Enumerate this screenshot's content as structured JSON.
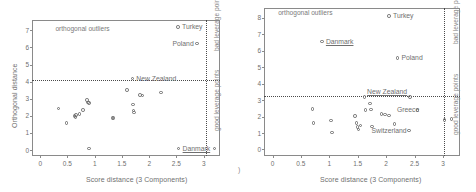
{
  "figure": {
    "panel_count": 2,
    "corner_mark": ")"
  },
  "chart_data": [
    {
      "type": "scatter",
      "title": "",
      "panel": "left",
      "xlabel": "Score distance (3 Components)",
      "ylabel": "Orthogonal distance",
      "xlim": [
        -0.15,
        3.3
      ],
      "ylim": [
        -0.35,
        7.6
      ],
      "xticks": [
        0,
        0.5,
        1,
        1.5,
        2,
        2.5,
        3
      ],
      "xticklabels": [
        "0",
        "0.5",
        "1",
        "1.5",
        "2",
        "2.5",
        "3"
      ],
      "yticks": [
        0,
        1,
        2,
        3,
        4,
        5,
        6,
        7
      ],
      "yticklabels": [
        "0",
        "1",
        "2",
        "3",
        "4",
        "5",
        "6",
        "7"
      ],
      "grid": false,
      "cutoff_horizontal": 4.1,
      "cutoff_vertical": 3.05,
      "annotations": [
        {
          "text": "orthogonal outliers",
          "x": 0.28,
          "y": 7.1,
          "underline": false
        },
        {
          "text": "bad leverage points",
          "x": 3.14,
          "y": 5.8,
          "rotated": true
        },
        {
          "text": "good leverage points",
          "x": 3.14,
          "y": 1.1,
          "rotated": true
        }
      ],
      "points": [
        {
          "x": 2.53,
          "y": 7.18,
          "label": "Turkey",
          "label_pos": "right"
        },
        {
          "x": 2.88,
          "y": 6.22,
          "label": "Poland",
          "label_pos": "left"
        },
        {
          "x": 1.69,
          "y": 4.18,
          "label": "New Zealand",
          "label_pos": "right"
        },
        {
          "x": 2.54,
          "y": 0.08,
          "label": "Danmark",
          "label_pos": "right",
          "underline": true
        },
        {
          "x": 3.2,
          "y": 0.08,
          "label": "",
          "label_pos": "none"
        },
        {
          "x": 0.34,
          "y": 2.44,
          "label": ""
        },
        {
          "x": 0.48,
          "y": 1.58,
          "label": ""
        },
        {
          "x": 0.63,
          "y": 1.98,
          "label": ""
        },
        {
          "x": 0.65,
          "y": 1.93,
          "label": ""
        },
        {
          "x": 0.66,
          "y": 2.05,
          "label": ""
        },
        {
          "x": 0.72,
          "y": 2.1,
          "label": ""
        },
        {
          "x": 0.79,
          "y": 2.33,
          "label": ""
        },
        {
          "x": 0.86,
          "y": 2.93,
          "label": ""
        },
        {
          "x": 0.88,
          "y": 2.78,
          "label": ""
        },
        {
          "x": 0.9,
          "y": 2.76,
          "label": ""
        },
        {
          "x": 0.9,
          "y": 0.08,
          "label": ""
        },
        {
          "x": 1.33,
          "y": 1.86,
          "label": ""
        },
        {
          "x": 1.35,
          "y": 1.86,
          "label": ""
        },
        {
          "x": 1.59,
          "y": 3.5,
          "label": ""
        },
        {
          "x": 1.7,
          "y": 2.67,
          "label": ""
        },
        {
          "x": 1.71,
          "y": 2.3,
          "label": ""
        },
        {
          "x": 1.72,
          "y": 2.18,
          "label": ""
        },
        {
          "x": 1.83,
          "y": 3.22,
          "label": ""
        },
        {
          "x": 1.88,
          "y": 3.18,
          "label": ""
        },
        {
          "x": 2.22,
          "y": 3.37,
          "label": ""
        }
      ]
    },
    {
      "type": "scatter",
      "title": "",
      "panel": "right",
      "xlabel": "Score distance (3 Components)",
      "ylabel": "",
      "xlim": [
        -0.15,
        3.3
      ],
      "ylim": [
        -0.4,
        8.6
      ],
      "xticks": [
        0,
        0.5,
        1,
        1.5,
        2,
        2.5,
        3
      ],
      "xticklabels": [
        "0",
        "0.5",
        "1",
        "1.5",
        "2",
        "2.5",
        "3"
      ],
      "yticks": [
        0,
        1,
        2,
        3,
        4,
        5,
        6,
        7,
        8
      ],
      "yticklabels": [
        "0",
        "1",
        "2",
        "3",
        "4",
        "5",
        "6",
        "7",
        "8"
      ],
      "grid": false,
      "cutoff_horizontal": 3.25,
      "cutoff_vertical": 3.02,
      "annotations": [
        {
          "text": "orthogonal outliers",
          "x": 0.1,
          "y": 8.3,
          "underline": false
        },
        {
          "text": "bad leverage points",
          "x": 3.12,
          "y": 6.4,
          "rotated": true
        },
        {
          "text": "good leverage points",
          "x": 3.12,
          "y": 0.9,
          "rotated": true
        }
      ],
      "points": [
        {
          "x": 2.05,
          "y": 8.1,
          "label": "Turkey",
          "label_pos": "right"
        },
        {
          "x": 0.87,
          "y": 6.55,
          "label": "Danmark",
          "label_pos": "right",
          "underline": true
        },
        {
          "x": 2.2,
          "y": 5.55,
          "label": "Poland",
          "label_pos": "right"
        },
        {
          "x": 2.42,
          "y": 3.18,
          "label": "New Zealand",
          "label_pos": "leftup",
          "underline": true
        },
        {
          "x": 3.03,
          "y": 1.78,
          "label": "",
          "label_pos": "none"
        },
        {
          "x": 3.15,
          "y": 1.85,
          "label": "",
          "label_pos": "none"
        },
        {
          "x": 0.7,
          "y": 2.45,
          "label": ""
        },
        {
          "x": 0.72,
          "y": 1.6,
          "label": ""
        },
        {
          "x": 1.03,
          "y": 1.75,
          "label": ""
        },
        {
          "x": 1.05,
          "y": 1.02,
          "label": ""
        },
        {
          "x": 1.45,
          "y": 2.02,
          "label": ""
        },
        {
          "x": 1.48,
          "y": 1.62,
          "label": ""
        },
        {
          "x": 1.5,
          "y": 1.35,
          "label": ""
        },
        {
          "x": 1.51,
          "y": 1.22,
          "label": ""
        },
        {
          "x": 1.55,
          "y": 1.45,
          "label": ""
        },
        {
          "x": 1.62,
          "y": 3.18,
          "label": ""
        },
        {
          "x": 1.64,
          "y": 2.4,
          "label": ""
        },
        {
          "x": 1.72,
          "y": 2.78,
          "label": ""
        },
        {
          "x": 1.73,
          "y": 2.42,
          "label": ""
        },
        {
          "x": 1.75,
          "y": 1.4,
          "label": ""
        },
        {
          "x": 1.92,
          "y": 2.15,
          "label": ""
        },
        {
          "x": 1.98,
          "y": 2.12,
          "label": ""
        },
        {
          "x": 2.05,
          "y": 2.05,
          "label": ""
        },
        {
          "x": 2.15,
          "y": 1.55,
          "label": ""
        },
        {
          "x": 2.55,
          "y": 2.4,
          "label": "Greece",
          "label_pos": "labelonly"
        },
        {
          "x": 2.4,
          "y": 1.15,
          "label": "Switzerland",
          "label_pos": "labelonly"
        }
      ]
    }
  ]
}
